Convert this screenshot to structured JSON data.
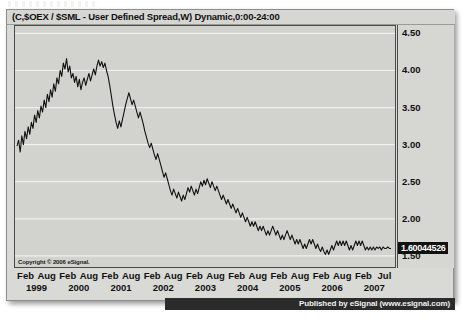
{
  "chart_title": "(C,$OEX / $SML - User Defined Spread,W) Dynamic,0:00-24:00",
  "copyright": "Copyright © 2006 eSignal.",
  "publisher": "Published by eSignal (www.esignal.com)",
  "current_price_label": "1.60044526",
  "chart_data": {
    "type": "line",
    "title": "(C,$OEX / $SML - User Defined Spread,W) Dynamic,0:00-24:00",
    "xlabel": "",
    "ylabel": "",
    "ylim": [
      1.35,
      4.6
    ],
    "yticks": [
      4.5,
      4.0,
      3.5,
      3.0,
      2.5,
      2.0,
      1.5
    ],
    "ytick_labels": [
      "4.50",
      "4.00",
      "3.50",
      "3.00",
      "2.50",
      "2.00",
      "1.50"
    ],
    "grid": true,
    "legend": false,
    "line_color": "#121212",
    "background": "#d2d2cf",
    "annotations": [
      {
        "type": "price-flag",
        "text": "1.60044526",
        "value": 1.60044526,
        "position": "right-axis"
      }
    ],
    "xtick_months": [
      "Feb",
      "Aug",
      "Feb",
      "Aug",
      "Feb",
      "Aug",
      "Feb",
      "Aug",
      "Feb",
      "Aug",
      "Feb",
      "Aug",
      "Feb",
      "Aug",
      "Feb",
      "Aug",
      "Feb",
      "Jul"
    ],
    "xtick_years": [
      "1999",
      "",
      "2000",
      "",
      "2001",
      "",
      "2002",
      "",
      "2003",
      "",
      "2004",
      "",
      "2005",
      "",
      "2006",
      "",
      "2007",
      ""
    ],
    "series": [
      {
        "name": "$OEX / $SML spread",
        "values": [
          2.98,
          3.06,
          2.9,
          3.12,
          3.0,
          3.18,
          3.08,
          3.24,
          3.14,
          3.3,
          3.22,
          3.4,
          3.3,
          3.46,
          3.36,
          3.52,
          3.44,
          3.6,
          3.5,
          3.68,
          3.58,
          3.74,
          3.64,
          3.82,
          3.72,
          3.9,
          3.82,
          4.0,
          3.92,
          4.1,
          4.02,
          4.16,
          3.98,
          4.06,
          3.9,
          3.96,
          3.84,
          3.92,
          3.78,
          3.88,
          3.74,
          3.84,
          3.9,
          3.8,
          3.88,
          3.96,
          3.86,
          3.94,
          4.02,
          3.94,
          4.06,
          4.14,
          4.06,
          4.12,
          4.04,
          4.1,
          4.0,
          3.92,
          3.8,
          3.66,
          3.52,
          3.4,
          3.3,
          3.22,
          3.32,
          3.24,
          3.34,
          3.44,
          3.54,
          3.62,
          3.7,
          3.62,
          3.54,
          3.6,
          3.52,
          3.44,
          3.36,
          3.44,
          3.36,
          3.28,
          3.18,
          3.1,
          3.02,
          2.96,
          3.02,
          2.94,
          2.86,
          2.8,
          2.88,
          2.8,
          2.72,
          2.64,
          2.56,
          2.62,
          2.54,
          2.46,
          2.38,
          2.32,
          2.4,
          2.34,
          2.28,
          2.36,
          2.3,
          2.24,
          2.32,
          2.26,
          2.34,
          2.42,
          2.36,
          2.44,
          2.38,
          2.32,
          2.4,
          2.34,
          2.42,
          2.5,
          2.44,
          2.52,
          2.46,
          2.54,
          2.48,
          2.42,
          2.5,
          2.44,
          2.38,
          2.44,
          2.38,
          2.32,
          2.26,
          2.32,
          2.26,
          2.2,
          2.26,
          2.2,
          2.14,
          2.2,
          2.14,
          2.08,
          2.14,
          2.08,
          2.02,
          2.08,
          2.02,
          1.96,
          2.02,
          1.96,
          1.9,
          1.96,
          1.9,
          1.96,
          1.9,
          1.84,
          1.9,
          1.84,
          1.9,
          1.84,
          1.78,
          1.84,
          1.78,
          1.84,
          1.9,
          1.84,
          1.78,
          1.84,
          1.78,
          1.72,
          1.78,
          1.72,
          1.78,
          1.84,
          1.78,
          1.72,
          1.78,
          1.72,
          1.66,
          1.72,
          1.66,
          1.72,
          1.66,
          1.6,
          1.66,
          1.6,
          1.66,
          1.72,
          1.66,
          1.72,
          1.66,
          1.6,
          1.66,
          1.6,
          1.56,
          1.62,
          1.56,
          1.52,
          1.58,
          1.52,
          1.58,
          1.64,
          1.58,
          1.64,
          1.7,
          1.64,
          1.7,
          1.64,
          1.7,
          1.64,
          1.7,
          1.64,
          1.58,
          1.64,
          1.58,
          1.64,
          1.7,
          1.64,
          1.7,
          1.64,
          1.7,
          1.64,
          1.58,
          1.62,
          1.58,
          1.62,
          1.58,
          1.62,
          1.58,
          1.62,
          1.6,
          1.62,
          1.58,
          1.62,
          1.6,
          1.6,
          1.62,
          1.6,
          1.6
        ]
      }
    ]
  }
}
